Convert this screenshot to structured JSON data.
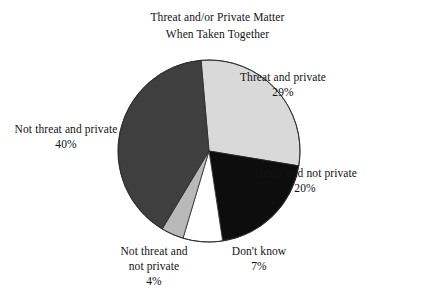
{
  "chart": {
    "title_lines": [
      "Threat and/or Private Matter",
      "When Taken Together"
    ]
  },
  "chart_data": {
    "type": "pie",
    "title": "Threat and/or Private Matter When Taken Together",
    "xlabel": "",
    "ylabel": "",
    "units": "percent",
    "start_angle_deg": -5,
    "direction": "clockwise",
    "legend": "none (direct labels around pie)",
    "grid": false,
    "categories": [
      "Threat and private",
      "Threat and not private",
      "Don't know",
      "Not threat and not private",
      "Not threat and private"
    ],
    "values": [
      29,
      20,
      7,
      4,
      40
    ],
    "colors": [
      "#d9d9d9",
      "#0d0d0d",
      "#ffffff",
      "#b9b9b9",
      "#3f3f3f"
    ],
    "slices": [
      {
        "label": "Threat and private",
        "value": 29,
        "value_text": "29%",
        "color": "#d9d9d9",
        "label_lines": [
          "Threat and private",
          "29%"
        ]
      },
      {
        "label": "Threat and not private",
        "value": 20,
        "value_text": "20%",
        "color": "#0d0d0d",
        "label_lines": [
          "Threat and not private",
          "20%"
        ]
      },
      {
        "label": "Don't know",
        "value": 7,
        "value_text": "7%",
        "color": "#ffffff",
        "label_lines": [
          "Don't know",
          "7%"
        ]
      },
      {
        "label": "Not threat and not private",
        "value": 4,
        "value_text": "4%",
        "color": "#b9b9b9",
        "label_lines": [
          "Not threat and",
          "not private",
          "4%"
        ]
      },
      {
        "label": "Not threat and private",
        "value": 40,
        "value_text": "40%",
        "color": "#3f3f3f",
        "label_lines": [
          "Not threat and private",
          "40%"
        ]
      }
    ]
  },
  "labels": {
    "threat_private": {
      "l1": "Threat and private",
      "l2": "29%"
    },
    "threat_not_private": {
      "l1": "Threat and not private",
      "l2": "20%"
    },
    "dont_know": {
      "l1": "Don't know",
      "l2": "7%"
    },
    "not_threat_not_private": {
      "l1": "Not threat and",
      "l2": "not private",
      "l3": "4%"
    },
    "not_threat_private": {
      "l1": "Not threat and private",
      "l2": "40%"
    }
  }
}
